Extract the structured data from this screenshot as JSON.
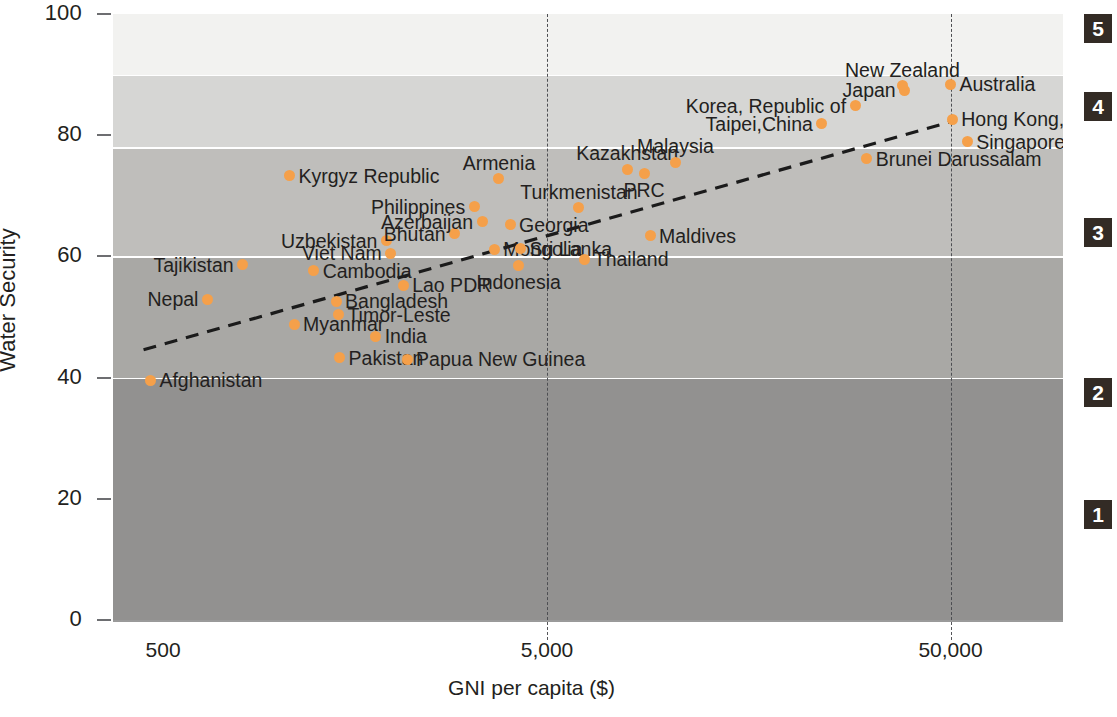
{
  "axes": {
    "ylabel": "Water Security",
    "xlabel": "GNI per capita ($)",
    "yticks": [
      "100",
      "80",
      "60",
      "40",
      "20",
      "0"
    ],
    "xticks": [
      "500",
      "5,000",
      "50,000"
    ]
  },
  "side_chips": [
    "5",
    "4",
    "3",
    "2",
    "1"
  ],
  "colors": {
    "marker": "#f5a04a",
    "chip_bg": "#332b25",
    "text": "#231f20"
  },
  "chart_data": {
    "type": "scatter",
    "title": "",
    "xlabel": "GNI per capita ($)",
    "ylabel": "Water Security",
    "xscale": "log",
    "xlim": [
      420,
      95000
    ],
    "ylim": [
      0,
      100
    ],
    "xticks": [
      500,
      5000,
      50000
    ],
    "yticks": [
      0,
      20,
      40,
      60,
      80,
      100
    ],
    "grid": "vertical-dashed",
    "legend": "none",
    "annotations": "country name labels beside each point",
    "trendline": {
      "style": "dashed",
      "label": "",
      "points": [
        [
          500,
          44.6
        ],
        [
          50000,
          82.2
        ]
      ]
    },
    "bands": [
      {
        "level": "1",
        "range": [
          0,
          40
        ]
      },
      {
        "level": "2",
        "range": [
          40,
          60
        ]
      },
      {
        "level": "3",
        "range": [
          60,
          78
        ]
      },
      {
        "level": "4",
        "range": [
          78,
          90
        ]
      },
      {
        "level": "5",
        "range": [
          90,
          100
        ]
      }
    ],
    "points": [
      {
        "name": "Afghanistan",
        "x": 520,
        "y": 39.6,
        "label_pos": "right"
      },
      {
        "name": "Nepal",
        "x": 720,
        "y": 52.9,
        "label_pos": "left"
      },
      {
        "name": "Tajikistan",
        "x": 880,
        "y": 58.6,
        "label_pos": "left"
      },
      {
        "name": "Myanmar",
        "x": 1180,
        "y": 48.8,
        "label_pos": "right"
      },
      {
        "name": "Kyrgyz Republic",
        "x": 1150,
        "y": 73.3,
        "label_pos": "right"
      },
      {
        "name": "Cambodia",
        "x": 1320,
        "y": 57.6,
        "label_pos": "right"
      },
      {
        "name": "Bangladesh",
        "x": 1500,
        "y": 52.6,
        "label_pos": "right"
      },
      {
        "name": "Timor-Leste",
        "x": 1520,
        "y": 50.4,
        "label_pos": "right"
      },
      {
        "name": "Pakistan",
        "x": 1530,
        "y": 43.3,
        "label_pos": "right"
      },
      {
        "name": "Uzbekistan",
        "x": 2000,
        "y": 62.6,
        "label_pos": "left"
      },
      {
        "name": "Viet Nam",
        "x": 2050,
        "y": 60.5,
        "label_pos": "left"
      },
      {
        "name": "India",
        "x": 1880,
        "y": 46.8,
        "label_pos": "right"
      },
      {
        "name": "Lao PDR",
        "x": 2200,
        "y": 55.2,
        "label_pos": "right"
      },
      {
        "name": "Papua New Guinea",
        "x": 2250,
        "y": 43.0,
        "label_pos": "right"
      },
      {
        "name": "Philippines",
        "x": 3300,
        "y": 68.2,
        "label_pos": "left"
      },
      {
        "name": "Bhutan",
        "x": 2950,
        "y": 63.7,
        "label_pos": "left"
      },
      {
        "name": "Azerbaijan",
        "x": 3450,
        "y": 65.7,
        "label_pos": "left"
      },
      {
        "name": "Mongolia",
        "x": 3700,
        "y": 61.2,
        "label_pos": "right"
      },
      {
        "name": "Armenia",
        "x": 3800,
        "y": 72.8,
        "label_pos": "above"
      },
      {
        "name": "Georgia",
        "x": 4050,
        "y": 65.2,
        "label_pos": "right"
      },
      {
        "name": "Sri Lanka",
        "x": 4300,
        "y": 61.3,
        "label_pos": "right"
      },
      {
        "name": "Indonesia",
        "x": 4250,
        "y": 58.5,
        "label_pos": "below"
      },
      {
        "name": "Turkmenistan",
        "x": 6000,
        "y": 68.0,
        "label_pos": "above"
      },
      {
        "name": "Thailand",
        "x": 6200,
        "y": 59.5,
        "label_pos": "right"
      },
      {
        "name": "Kazakhstan",
        "x": 7900,
        "y": 74.4,
        "label_pos": "above"
      },
      {
        "name": "PRC",
        "x": 8700,
        "y": 73.7,
        "label_pos": "below"
      },
      {
        "name": "Maldives",
        "x": 9000,
        "y": 63.4,
        "label_pos": "right"
      },
      {
        "name": "Malaysia",
        "x": 10400,
        "y": 75.5,
        "label_pos": "above"
      },
      {
        "name": "Taipei,China",
        "x": 24000,
        "y": 81.9,
        "label_pos": "left"
      },
      {
        "name": "Korea, Republic of",
        "x": 29000,
        "y": 84.9,
        "label_pos": "left"
      },
      {
        "name": "New Zealand",
        "x": 38000,
        "y": 88.2,
        "label_pos": "above"
      },
      {
        "name": "Japan",
        "x": 38500,
        "y": 87.4,
        "label_pos": "left"
      },
      {
        "name": "Brunei Darussalam",
        "x": 31000,
        "y": 76.1,
        "label_pos": "right"
      },
      {
        "name": "Australia",
        "x": 50000,
        "y": 88.4,
        "label_pos": "right"
      },
      {
        "name": "Hong Kong, China",
        "x": 50500,
        "y": 82.6,
        "label_pos": "right"
      },
      {
        "name": "Singapore",
        "x": 55000,
        "y": 78.9,
        "label_pos": "right"
      }
    ]
  }
}
